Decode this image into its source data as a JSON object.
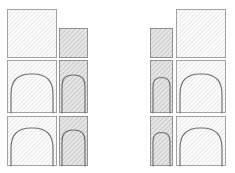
{
  "drawing": {
    "title": "Arch Elevation Study Sketch",
    "canvas": {
      "width": 235,
      "height": 173,
      "background": "#ffffff"
    },
    "style": {
      "hatch_angle_deg": 45,
      "hatch_light_color": "#c9c9c9",
      "hatch_dark_color": "#a8a8a8",
      "fill_light": "#fdfdfd",
      "fill_dark": "#e6e6e6",
      "outline_color": "#9a9a9a",
      "arch_stroke_color": "#6f6f6f",
      "line_weight": 0.9
    },
    "groups": [
      {
        "name": "left-group",
        "orientation": "large-left",
        "rows": [
          {
            "name": "top-row",
            "panels": [
              {
                "name": "large-plain-panel",
                "shade": "light",
                "x": 7,
                "y": 9,
                "w": 50,
                "h": 49,
                "arch": false
              },
              {
                "name": "small-plain-panel",
                "shade": "dark",
                "x": 59,
                "y": 28,
                "w": 29,
                "h": 30,
                "arch": false
              }
            ]
          },
          {
            "name": "middle-row",
            "panels": [
              {
                "name": "large-arch-panel",
                "shade": "light",
                "x": 7,
                "y": 60,
                "w": 50,
                "h": 53,
                "arch": true,
                "arch_inset": 4,
                "arch_spring_y": 34,
                "arch_radius": 20
              },
              {
                "name": "small-arch-panel",
                "shade": "dark",
                "x": 59,
                "y": 60,
                "w": 29,
                "h": 53,
                "arch": true,
                "arch_inset": 3,
                "arch_spring_y": 26,
                "arch_radius": 11
              }
            ]
          },
          {
            "name": "bottom-row",
            "panels": [
              {
                "name": "large-arch-panel",
                "shade": "light",
                "x": 7,
                "y": 116,
                "w": 50,
                "h": 50,
                "arch": true,
                "arch_inset": 4,
                "arch_spring_y": 32,
                "arch_radius": 20
              },
              {
                "name": "small-arch-panel",
                "shade": "dark",
                "x": 59,
                "y": 116,
                "w": 29,
                "h": 50,
                "arch": true,
                "arch_inset": 3,
                "arch_spring_y": 25,
                "arch_radius": 11
              }
            ]
          }
        ]
      },
      {
        "name": "right-group",
        "orientation": "large-right",
        "rows": [
          {
            "name": "top-row",
            "panels": [
              {
                "name": "small-plain-panel",
                "shade": "dark",
                "x": 150,
                "y": 28,
                "w": 23,
                "h": 30,
                "arch": false
              },
              {
                "name": "large-plain-panel",
                "shade": "light",
                "x": 176,
                "y": 9,
                "w": 50,
                "h": 49,
                "arch": false
              }
            ]
          },
          {
            "name": "middle-row",
            "panels": [
              {
                "name": "small-arch-panel",
                "shade": "dark",
                "x": 150,
                "y": 60,
                "w": 23,
                "h": 53,
                "arch": true,
                "arch_inset": 3,
                "arch_spring_y": 26,
                "arch_radius": 9
              },
              {
                "name": "large-arch-panel",
                "shade": "light",
                "x": 176,
                "y": 60,
                "w": 50,
                "h": 53,
                "arch": true,
                "arch_inset": 4,
                "arch_spring_y": 34,
                "arch_radius": 20
              }
            ]
          },
          {
            "name": "bottom-row",
            "panels": [
              {
                "name": "small-arch-panel",
                "shade": "dark",
                "x": 150,
                "y": 116,
                "w": 23,
                "h": 50,
                "arch": true,
                "arch_inset": 3,
                "arch_spring_y": 25,
                "arch_radius": 9
              },
              {
                "name": "large-arch-panel",
                "shade": "light",
                "x": 176,
                "y": 116,
                "w": 50,
                "h": 50,
                "arch": true,
                "arch_inset": 4,
                "arch_spring_y": 32,
                "arch_radius": 20
              }
            ]
          }
        ]
      }
    ]
  }
}
